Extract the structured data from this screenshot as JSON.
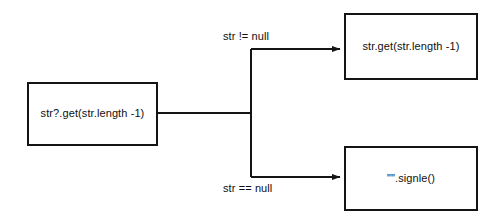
{
  "diagram": {
    "background_color": "#ffffff",
    "stroke_color": "#141414",
    "text_color": "#0f0f0f",
    "nodes": [
      {
        "id": "source",
        "name": "source-expression",
        "label": "str?.get(str.length -1)",
        "x": 27,
        "y": 82,
        "width": 131,
        "height": 64
      },
      {
        "id": "true_branch",
        "name": "not-null-result",
        "label": "str.get(str.length -1)",
        "x": 344,
        "y": 13,
        "width": 134,
        "height": 67
      },
      {
        "id": "false_branch",
        "name": "is-null-result",
        "label": "\"\".signle()",
        "x": 344,
        "y": 146,
        "width": 134,
        "height": 65
      }
    ],
    "edges": [
      {
        "id": "edge_not_null",
        "from": "source",
        "to": "true_branch",
        "label": "str != null",
        "label_x": 223,
        "label_y": 30,
        "arrowhead": true
      },
      {
        "id": "edge_is_null",
        "from": "source",
        "to": "false_branch",
        "label": "str == null",
        "label_x": 223,
        "label_y": 182,
        "arrowhead": true
      }
    ],
    "junction": {
      "name": "branch-junction",
      "x": 251,
      "top_y": 49,
      "bottom_y": 177,
      "stem_y": 113
    }
  }
}
